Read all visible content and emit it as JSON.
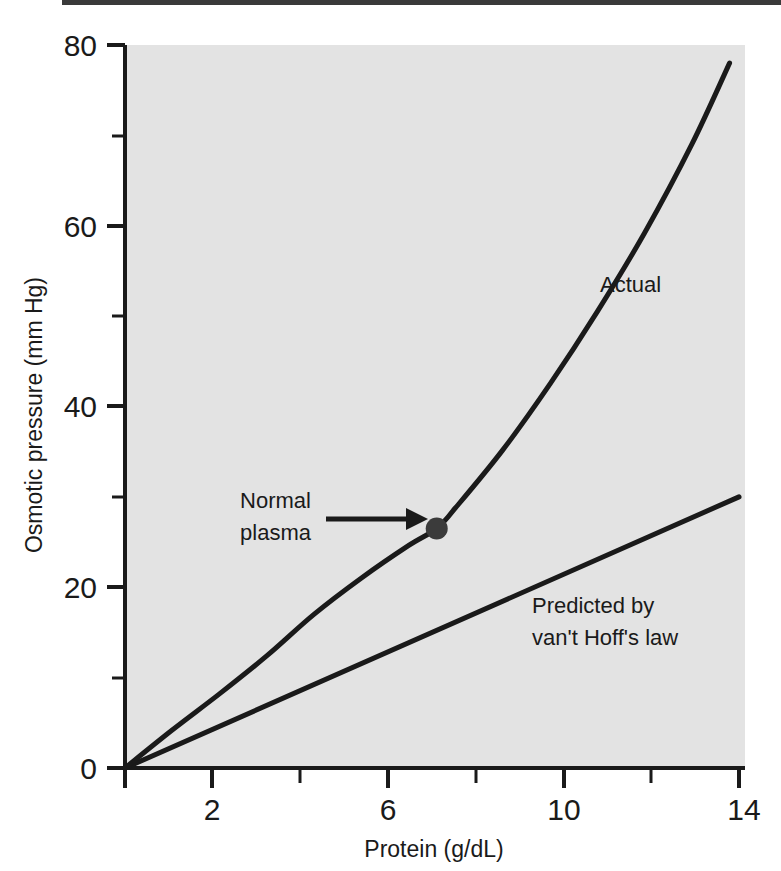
{
  "figure": {
    "background_color": "#ffffff",
    "plot_background_color": "#e3e3e3",
    "ink_color": "#1a1a1a"
  },
  "chart_data": {
    "type": "line",
    "title": "",
    "subtitle": "",
    "xlabel": "Protein (g/dL)",
    "ylabel": "Osmotic pressure (mm Hg)",
    "xlim": [
      1,
      14
    ],
    "ylim": [
      0,
      80
    ],
    "xticks": [
      1,
      2,
      4,
      6,
      8,
      10,
      12,
      14
    ],
    "xtick_labels": [
      "",
      "2",
      "",
      "6",
      "",
      "10",
      "",
      "14"
    ],
    "yticks": [
      0,
      10,
      20,
      30,
      40,
      50,
      60,
      70,
      80
    ],
    "ytick_labels": [
      "0",
      "",
      "20",
      "",
      "40",
      "",
      "60",
      "",
      "80"
    ],
    "grid": false,
    "legend_position": "inline-annotations",
    "series": [
      {
        "name": "Actual",
        "label_text": "Actual",
        "x": [
          1,
          2,
          3,
          4,
          5,
          6,
          7,
          7.6,
          8,
          9,
          10,
          11,
          12,
          13,
          13.8
        ],
        "y": [
          0,
          4.2,
          8.2,
          12.4,
          17.0,
          21.0,
          24.6,
          26.5,
          28.8,
          35.2,
          42.5,
          50.5,
          59.2,
          69.0,
          78.0
        ]
      },
      {
        "name": "Predicted by van't Hoff's law",
        "label_text": "Predicted by\nvan't Hoff's law",
        "label_line1": "Predicted by",
        "label_line2": "van't Hoff's law",
        "x": [
          1,
          14
        ],
        "y": [
          0,
          30
        ]
      }
    ],
    "annotations": [
      {
        "name": "normal-plasma",
        "label_line1": "Normal",
        "label_line2": "plasma",
        "point_x": 7.6,
        "point_y": 26.5,
        "marker": "filled-circle",
        "arrow": "right"
      },
      {
        "name": "actual-curve-label",
        "text": "Actual",
        "at_x": 10.2,
        "at_y": 52
      },
      {
        "name": "vant-hoff-label",
        "line1": "Predicted by",
        "line2": "van't Hoff's law",
        "at_x": 11.6,
        "at_y": 18
      }
    ]
  },
  "axis": {
    "y_title": "Osmotic pressure (mm Hg)",
    "x_title": "Protein (g/dL)",
    "y_labels": [
      "80",
      "60",
      "40",
      "20",
      "0"
    ],
    "x_labels": [
      "2",
      "6",
      "10",
      "14"
    ]
  },
  "labels": {
    "actual": "Actual",
    "normal_line1": "Normal",
    "normal_line2": "plasma",
    "vanthoff_line1": "Predicted by",
    "vanthoff_line2": "van't Hoff's law"
  }
}
